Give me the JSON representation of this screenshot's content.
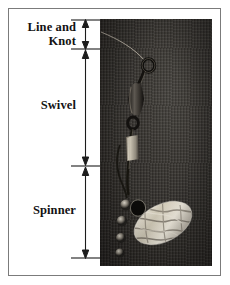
{
  "figure": {
    "background_color": "#ffffff",
    "border_color": "#7b7b7b"
  },
  "labels": [
    {
      "id": "line-and-knot",
      "text": "Line and\nKnot",
      "line1": "Line and",
      "line2": "Knot"
    },
    {
      "id": "swivel",
      "text": "Swivel"
    },
    {
      "id": "spinner",
      "text": "Spinner"
    }
  ],
  "label_line_knot": "Line and\nKnot",
  "label_line_knot_1": "Line and",
  "label_line_knot_2": "Knot",
  "label_swivel": "Swivel",
  "label_spinner": "Spinner",
  "dimension_arrows": [
    {
      "name": "line-and-knot-extent",
      "top": 20,
      "bottom": 48
    },
    {
      "name": "swivel-extent",
      "top": 50,
      "bottom": 164
    },
    {
      "name": "spinner-extent",
      "top": 168,
      "bottom": 258
    }
  ],
  "tick_marks_y": [
    20,
    49,
    166,
    258
  ],
  "photo": {
    "name": "fishing-spinner-photograph",
    "alt": "Close-up photograph of a fishing spinner lure on dark textured background",
    "x": 100,
    "y": 19,
    "width": 112,
    "height": 247,
    "background_color": "#332f2b",
    "components": [
      {
        "name": "fishing-line",
        "description": "thin monofilament line entering from upper left"
      },
      {
        "name": "knot",
        "description": "knot tied at the swivel eye"
      },
      {
        "name": "swivel-eye",
        "description": "round wire loop"
      },
      {
        "name": "swivel-barrel",
        "description": "dark metal barrel body"
      },
      {
        "name": "wire-shaft",
        "description": "thin wire shaft below the swivel"
      },
      {
        "name": "sleeve-bead",
        "description": "light colored sleeve on the shaft"
      },
      {
        "name": "beads",
        "description": "small beads above the blade"
      },
      {
        "name": "spinner-blade",
        "description": "bright oval engraved spinner blade"
      }
    ],
    "blade_color": "#d8d2c4"
  },
  "colors": {
    "ink": "#131313",
    "rule": "#2a2a2a",
    "frame": "#7b7b7b",
    "photo_dark": "#2c2a28",
    "photo_light": "#e2dccd"
  }
}
